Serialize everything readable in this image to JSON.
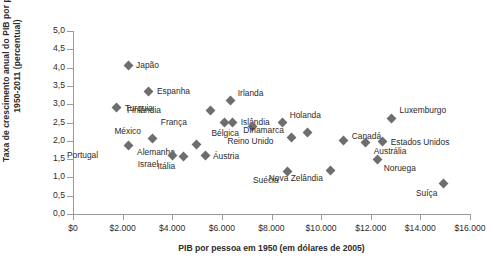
{
  "chart_data": {
    "type": "scatter",
    "title": "",
    "xlabel": "PIB por pessoa em 1950 (em dólares de 2005)",
    "ylabel_line1": "Taxa de crescimento anual do PIB por pessoa,",
    "ylabel_line2": "1950-2011 (percentual)",
    "xlim": [
      0,
      16000
    ],
    "ylim": [
      0,
      5.0
    ],
    "grid": false,
    "legend": "none",
    "marker": "diamond",
    "marker_color": "#6e6e6e",
    "xticks": [
      0,
      2000,
      4000,
      6000,
      8000,
      10000,
      12000,
      14000,
      16000
    ],
    "xtick_labels": [
      "$0",
      "$2.000",
      "$4.000",
      "$6.000",
      "$8.000",
      "$10.000",
      "$12.000",
      "$14.000",
      "$16.000"
    ],
    "yticks": [
      0,
      0.5,
      1.0,
      1.5,
      2.0,
      2.5,
      3.0,
      3.5,
      4.0,
      4.5,
      5.0
    ],
    "ytick_labels": [
      "0,0",
      "0,5",
      "1,0",
      "1,5",
      "2,0",
      "2,5",
      "3,0",
      "3,5",
      "4,0",
      "4,5",
      "5,0"
    ],
    "points": [
      {
        "label": "Japão",
        "x": 2220,
        "y": 4.07,
        "lx": 8,
        "ly": -5
      },
      {
        "label": "Espanha",
        "x": 3060,
        "y": 3.36,
        "lx": 8,
        "ly": -5
      },
      {
        "label": "Turquia",
        "x": 1770,
        "y": 2.9,
        "lx": 8,
        "ly": -5
      },
      {
        "label": "Irlanda",
        "x": 6360,
        "y": 3.09,
        "lx": 7,
        "ly": -13
      },
      {
        "label": "Finlândia",
        "x": 5560,
        "y": 2.84,
        "lx": -50,
        "ly": -5
      },
      {
        "label": "França",
        "x": 6120,
        "y": 2.51,
        "lx": -38,
        "ly": -5
      },
      {
        "label": "Islândia",
        "x": 6440,
        "y": 2.51,
        "lx": 8,
        "ly": -5
      },
      {
        "label": "Holanda",
        "x": 8450,
        "y": 2.49,
        "lx": 7,
        "ly": -13
      },
      {
        "label": "Luxemburgo",
        "x": 12840,
        "y": 2.62,
        "lx": 8,
        "ly": -13
      },
      {
        "label": "México",
        "x": 3220,
        "y": 2.05,
        "lx": -12,
        "ly": -13
      },
      {
        "label": "Alemanha",
        "x": 4990,
        "y": 1.89,
        "lx": -22,
        "ly": 2
      },
      {
        "label": "Bélgica",
        "x": 7250,
        "y": 2.4,
        "lx": -14,
        "ly": 2
      },
      {
        "label": "Dinamarca",
        "x": 8820,
        "y": 2.08,
        "lx": -8,
        "ly": -13
      },
      {
        "label": "Canadá",
        "x": 10910,
        "y": 2.02,
        "lx": 8,
        "ly": -9
      },
      {
        "label": "Estados Unidos",
        "x": 12480,
        "y": 1.97,
        "lx": 8,
        "ly": -5
      },
      {
        "label": "Austrália",
        "x": 11800,
        "y": 1.94,
        "lx": 8,
        "ly": 3
      },
      {
        "label": "Portugal",
        "x": 2220,
        "y": 1.86,
        "lx": -30,
        "ly": 4
      },
      {
        "label": "Israel",
        "x": 4000,
        "y": 1.61,
        "lx": -14,
        "ly": 4
      },
      {
        "label": "Itália",
        "x": 4440,
        "y": 1.56,
        "lx": -8,
        "ly": 4
      },
      {
        "label": "Áustria",
        "x": 5320,
        "y": 1.61,
        "lx": 8,
        "ly": -4
      },
      {
        "label": "Reino Unido",
        "x": 9450,
        "y": 2.24,
        "lx": -34,
        "ly": 4
      },
      {
        "label": "Noruega",
        "x": 12280,
        "y": 1.48,
        "lx": 6,
        "ly": 3
      },
      {
        "label": "Suécia",
        "x": 8650,
        "y": 1.15,
        "lx": -9,
        "ly": 3
      },
      {
        "label": "Nova Zelândia",
        "x": 10390,
        "y": 1.2,
        "lx": -8,
        "ly": 3
      },
      {
        "label": "Suíça",
        "x": 14930,
        "y": 0.82,
        "lx": -6,
        "ly": 4
      }
    ]
  }
}
